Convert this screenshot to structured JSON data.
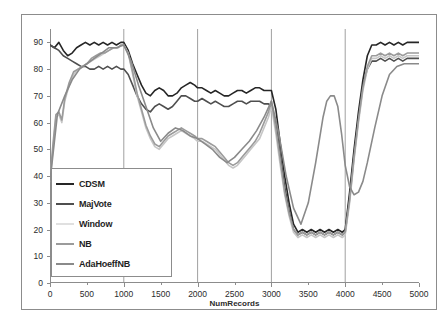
{
  "chart_data": {
    "type": "line",
    "title": "",
    "xlabel": "NumRecords",
    "ylabel": "Accuracy(%)",
    "xlim": [
      0,
      5000
    ],
    "ylim": [
      0,
      95
    ],
    "xticks": [
      0,
      500,
      1000,
      1500,
      2000,
      2500,
      3000,
      3500,
      4000,
      4500,
      5000
    ],
    "yticks": [
      0,
      10,
      20,
      30,
      40,
      50,
      60,
      70,
      80,
      90
    ],
    "grid": "vertical-major",
    "gridlines_x": [
      1000,
      2000,
      3000,
      4000
    ],
    "legend_position": "lower-left-inside",
    "series": [
      {
        "name": "CDSM",
        "color": "#262626",
        "x": [
          0,
          60,
          120,
          180,
          240,
          300,
          360,
          420,
          480,
          540,
          600,
          660,
          720,
          780,
          840,
          900,
          960,
          1000,
          1060,
          1120,
          1180,
          1240,
          1300,
          1360,
          1420,
          1480,
          1540,
          1600,
          1660,
          1720,
          1780,
          1840,
          1900,
          1960,
          2000,
          2060,
          2120,
          2180,
          2240,
          2300,
          2360,
          2420,
          2480,
          2540,
          2600,
          2660,
          2720,
          2780,
          2840,
          2900,
          2960,
          3000,
          3060,
          3120,
          3180,
          3240,
          3300,
          3360,
          3420,
          3480,
          3540,
          3600,
          3660,
          3720,
          3780,
          3840,
          3900,
          3960,
          4000,
          4060,
          4120,
          4180,
          4240,
          4300,
          4360,
          4420,
          4480,
          4540,
          4600,
          4660,
          4720,
          4780,
          4840,
          4900,
          4960,
          5000
        ],
        "y": [
          89,
          88,
          90,
          87,
          85,
          86,
          88,
          89,
          90,
          89,
          90,
          89,
          90,
          89,
          90,
          89,
          90,
          90,
          87,
          82,
          78,
          74,
          71,
          70,
          72,
          73,
          72,
          70,
          70,
          71,
          73,
          74,
          75,
          74,
          73,
          73,
          72,
          71,
          72,
          71,
          70,
          70,
          71,
          72,
          72,
          71,
          72,
          73,
          73,
          72,
          72,
          72,
          65,
          52,
          40,
          30,
          22,
          19,
          20,
          19,
          20,
          19,
          20,
          19,
          20,
          19,
          20,
          19,
          20,
          34,
          50,
          64,
          76,
          85,
          89,
          89,
          90,
          89,
          90,
          89,
          90,
          89,
          90,
          90,
          90,
          90
        ]
      },
      {
        "name": "MajVote",
        "color": "#4f4f4f",
        "x": [
          0,
          60,
          120,
          180,
          240,
          300,
          360,
          420,
          480,
          540,
          600,
          660,
          720,
          780,
          840,
          900,
          960,
          1000,
          1060,
          1120,
          1180,
          1240,
          1300,
          1360,
          1420,
          1480,
          1540,
          1600,
          1660,
          1720,
          1780,
          1840,
          1900,
          1960,
          2000,
          2060,
          2120,
          2180,
          2240,
          2300,
          2360,
          2420,
          2480,
          2540,
          2600,
          2660,
          2720,
          2780,
          2840,
          2900,
          2960,
          3000,
          3060,
          3120,
          3180,
          3240,
          3300,
          3360,
          3420,
          3480,
          3540,
          3600,
          3660,
          3720,
          3780,
          3840,
          3900,
          3960,
          4000,
          4060,
          4120,
          4180,
          4240,
          4300,
          4360,
          4420,
          4480,
          4540,
          4600,
          4660,
          4720,
          4780,
          4840,
          4900,
          4960,
          5000
        ],
        "y": [
          89,
          88,
          87,
          85,
          84,
          83,
          82,
          81,
          81,
          80,
          80,
          81,
          80,
          81,
          80,
          81,
          80,
          80,
          78,
          74,
          70,
          67,
          65,
          64,
          66,
          67,
          66,
          65,
          66,
          68,
          70,
          70,
          69,
          68,
          68,
          69,
          68,
          67,
          68,
          67,
          66,
          66,
          67,
          68,
          68,
          67,
          68,
          68,
          68,
          67,
          67,
          66,
          60,
          48,
          36,
          27,
          20,
          18,
          19,
          18,
          19,
          18,
          19,
          18,
          19,
          18,
          19,
          18,
          19,
          32,
          48,
          62,
          74,
          80,
          83,
          83,
          84,
          83,
          84,
          83,
          84,
          83,
          84,
          84,
          84,
          84
        ]
      },
      {
        "name": "Window",
        "color": "#c6c6c6",
        "x": [
          0,
          40,
          80,
          120,
          160,
          200,
          260,
          320,
          380,
          440,
          500,
          560,
          620,
          680,
          740,
          800,
          860,
          920,
          960,
          1000,
          1060,
          1120,
          1180,
          1240,
          1300,
          1360,
          1420,
          1480,
          1540,
          1600,
          1660,
          1720,
          1780,
          1840,
          1900,
          1960,
          2000,
          2060,
          2120,
          2180,
          2240,
          2300,
          2360,
          2420,
          2480,
          2540,
          2600,
          2660,
          2720,
          2780,
          2840,
          2900,
          2960,
          3000,
          3060,
          3120,
          3180,
          3240,
          3300,
          3360,
          3420,
          3480,
          3540,
          3600,
          3660,
          3720,
          3780,
          3840,
          3900,
          3960,
          4000,
          4060,
          4120,
          4180,
          4240,
          4300,
          4360,
          4420,
          4480,
          4540,
          4600,
          4660,
          4720,
          4780,
          4840,
          4900,
          4960,
          5000
        ],
        "y": [
          38,
          50,
          62,
          63,
          60,
          68,
          74,
          78,
          80,
          81,
          82,
          83,
          84,
          85,
          86,
          87,
          88,
          88,
          89,
          89,
          86,
          78,
          70,
          64,
          58,
          54,
          51,
          50,
          52,
          54,
          55,
          56,
          57,
          56,
          55,
          54,
          53,
          53,
          52,
          51,
          50,
          48,
          46,
          44,
          43,
          44,
          46,
          48,
          50,
          52,
          54,
          58,
          62,
          66,
          56,
          44,
          33,
          25,
          19,
          17,
          18,
          17,
          18,
          17,
          18,
          17,
          18,
          17,
          18,
          17,
          18,
          30,
          46,
          60,
          72,
          80,
          84,
          84,
          85,
          84,
          85,
          84,
          85,
          84,
          85,
          85,
          85,
          85
        ]
      },
      {
        "name": "NB",
        "color": "#9b9b9b",
        "x": [
          0,
          40,
          80,
          120,
          160,
          200,
          260,
          320,
          380,
          440,
          500,
          560,
          620,
          680,
          740,
          800,
          860,
          920,
          960,
          1000,
          1060,
          1120,
          1180,
          1240,
          1300,
          1360,
          1420,
          1480,
          1540,
          1600,
          1660,
          1720,
          1780,
          1840,
          1900,
          1960,
          2000,
          2060,
          2120,
          2180,
          2240,
          2300,
          2360,
          2420,
          2480,
          2540,
          2600,
          2660,
          2720,
          2780,
          2840,
          2900,
          2960,
          3000,
          3060,
          3120,
          3180,
          3240,
          3300,
          3360,
          3420,
          3480,
          3540,
          3600,
          3660,
          3720,
          3780,
          3840,
          3900,
          3960,
          4000,
          4060,
          4120,
          4180,
          4240,
          4300,
          4360,
          4420,
          4480,
          4540,
          4600,
          4660,
          4720,
          4780,
          4840,
          4900,
          4960,
          5000
        ],
        "y": [
          39,
          52,
          63,
          64,
          61,
          69,
          75,
          79,
          80,
          81,
          82,
          84,
          85,
          86,
          86,
          87,
          88,
          88,
          89,
          89,
          86,
          79,
          71,
          65,
          59,
          55,
          52,
          51,
          53,
          55,
          56,
          57,
          58,
          57,
          56,
          55,
          54,
          54,
          53,
          52,
          51,
          49,
          47,
          45,
          44,
          45,
          47,
          49,
          51,
          53,
          56,
          60,
          64,
          68,
          58,
          46,
          34,
          26,
          20,
          18,
          19,
          18,
          19,
          18,
          19,
          18,
          19,
          18,
          19,
          18,
          19,
          31,
          47,
          61,
          73,
          81,
          85,
          85,
          86,
          85,
          86,
          85,
          86,
          85,
          86,
          86,
          86,
          86
        ]
      },
      {
        "name": "AdaHoeffNB",
        "color": "#8a8a8a",
        "x": [
          0,
          100,
          200,
          300,
          400,
          500,
          600,
          700,
          800,
          900,
          1000,
          1100,
          1200,
          1300,
          1400,
          1500,
          1600,
          1700,
          1800,
          1900,
          2000,
          2100,
          2200,
          2300,
          2400,
          2500,
          2600,
          2700,
          2800,
          2900,
          3000,
          3100,
          3200,
          3300,
          3400,
          3500,
          3600,
          3700,
          3750,
          3800,
          3850,
          3900,
          3950,
          4000,
          4060,
          4120,
          4180,
          4240,
          4300,
          4400,
          4500,
          4600,
          4700,
          4800,
          4900,
          5000
        ],
        "y": [
          38,
          63,
          70,
          76,
          80,
          82,
          84,
          86,
          88,
          88,
          89,
          83,
          74,
          66,
          58,
          53,
          56,
          58,
          57,
          55,
          54,
          52,
          50,
          47,
          45,
          47,
          50,
          53,
          57,
          62,
          68,
          56,
          40,
          28,
          22,
          30,
          45,
          62,
          68,
          70,
          70,
          66,
          56,
          44,
          36,
          33,
          34,
          38,
          45,
          58,
          70,
          78,
          81,
          82,
          82,
          82
        ]
      }
    ]
  },
  "legend": {
    "items": [
      {
        "label": "CDSM",
        "color": "#262626"
      },
      {
        "label": "MajVote",
        "color": "#4f4f4f"
      },
      {
        "label": "Window",
        "color": "#e0e0e0"
      },
      {
        "label": "NB",
        "color": "#9b9b9b"
      },
      {
        "label": "AdaHoeffNB",
        "color": "#8a8a8a"
      }
    ]
  }
}
